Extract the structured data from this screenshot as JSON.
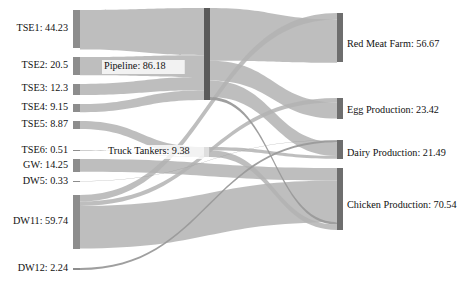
{
  "chart_data": {
    "type": "sankey",
    "title": "",
    "subtitle": "",
    "xlabel": "",
    "ylabel": "",
    "grid": false,
    "legend": "none",
    "background_color": "#ffffff",
    "node_color_source": "#8d8d8d",
    "node_color_middle": "#5a5a5a",
    "node_color_target": "#6e6e6e",
    "link_color": "#b3b3b3",
    "link_color_dark": "#9a9a9a",
    "label_color": "#111111",
    "value_separator": ": ",
    "nodes": [
      {
        "id": "TSE1",
        "label": "TSE1",
        "value": 44.23,
        "display": "TSE1: 44.23",
        "column": "source",
        "label_side": "left"
      },
      {
        "id": "TSE2",
        "label": "TSE2",
        "value": 20.5,
        "display": "TSE2: 20.5",
        "column": "source",
        "label_side": "left"
      },
      {
        "id": "TSE3",
        "label": "TSE3",
        "value": 12.3,
        "display": "TSE3: 12.3",
        "column": "source",
        "label_side": "left"
      },
      {
        "id": "TSE4",
        "label": "TSE4",
        "value": 9.15,
        "display": "TSE4: 9.15",
        "column": "source",
        "label_side": "left"
      },
      {
        "id": "TSE5",
        "label": "TSE5",
        "value": 8.87,
        "display": "TSE5: 8.87",
        "column": "source",
        "label_side": "left"
      },
      {
        "id": "TSE6",
        "label": "TSE6",
        "value": 0.51,
        "display": "TSE6: 0.51",
        "column": "source",
        "label_side": "left"
      },
      {
        "id": "GW",
        "label": "GW",
        "value": 14.25,
        "display": "GW: 14.25",
        "column": "source",
        "label_side": "left"
      },
      {
        "id": "DW5",
        "label": "DW5",
        "value": 0.33,
        "display": "DW5: 0.33",
        "column": "source",
        "label_side": "left"
      },
      {
        "id": "DW11",
        "label": "DW11",
        "value": 59.74,
        "display": "DW11: 59.74",
        "column": "source",
        "label_side": "left"
      },
      {
        "id": "DW12",
        "label": "DW12",
        "value": 2.24,
        "display": "DW12: 2.24",
        "column": "source",
        "label_side": "left"
      },
      {
        "id": "Pipeline",
        "label": "Pipeline",
        "value": 86.18,
        "display": "Pipeline: 86.18",
        "column": "middle",
        "label_side": "mid"
      },
      {
        "id": "TruckTankers",
        "label": "Truck Tankers",
        "value": 9.38,
        "display": "Truck Tankers: 9.38",
        "column": "middle",
        "label_side": "mid"
      },
      {
        "id": "RedMeatFarm",
        "label": "Red Meat Farm",
        "value": 56.67,
        "display": "Red Meat Farm: 56.67",
        "column": "target",
        "label_side": "right"
      },
      {
        "id": "EggProduction",
        "label": "Egg Production",
        "value": 23.42,
        "display": "Egg Production: 23.42",
        "column": "target",
        "label_side": "right"
      },
      {
        "id": "DairyProduction",
        "label": "Dairy Production",
        "value": 21.49,
        "display": "Dairy Production: 21.49",
        "column": "target",
        "label_side": "right"
      },
      {
        "id": "ChickenProduction",
        "label": "Chicken Production",
        "value": 70.54,
        "display": "Chicken Production: 70.54",
        "column": "target",
        "label_side": "right"
      }
    ],
    "links": [
      {
        "source": "TSE1",
        "target": "Pipeline",
        "value": 44.23
      },
      {
        "source": "TSE2",
        "target": "Pipeline",
        "value": 20.5
      },
      {
        "source": "TSE3",
        "target": "Pipeline",
        "value": 12.3
      },
      {
        "source": "TSE4",
        "target": "Pipeline",
        "value": 9.15
      },
      {
        "source": "TSE5",
        "target": "TruckTankers",
        "value": 8.87
      },
      {
        "source": "TSE6",
        "target": "TruckTankers",
        "value": 0.51
      },
      {
        "source": "GW",
        "target": "ChickenProduction",
        "value": 14.25
      },
      {
        "source": "DW5",
        "target": "DairyProduction",
        "value": 0.33
      },
      {
        "source": "DW11",
        "target": "ChickenProduction",
        "value": 47.54
      },
      {
        "source": "DW11",
        "target": "RedMeatFarm",
        "value": 7.3
      },
      {
        "source": "DW11",
        "target": "EggProduction",
        "value": 4.9
      },
      {
        "source": "DW12",
        "target": "DairyProduction",
        "value": 2.24
      },
      {
        "source": "Pipeline",
        "target": "RedMeatFarm",
        "value": 49.37
      },
      {
        "source": "Pipeline",
        "target": "EggProduction",
        "value": 18.52
      },
      {
        "source": "Pipeline",
        "target": "DairyProduction",
        "value": 15.54
      },
      {
        "source": "Pipeline",
        "target": "ChickenProduction",
        "value": 2.75
      },
      {
        "source": "TruckTankers",
        "target": "DairyProduction",
        "value": 3.38
      },
      {
        "source": "TruckTankers",
        "target": "ChickenProduction",
        "value": 6.0
      }
    ]
  },
  "layout": {
    "source_nodes": [
      {
        "id": "TSE1",
        "x": 73,
        "y": 10,
        "w": 7,
        "h": 38,
        "label_x": 68,
        "label_y": 29
      },
      {
        "id": "TSE2",
        "x": 73,
        "y": 57,
        "w": 7,
        "h": 18,
        "label_x": 68,
        "label_y": 66
      },
      {
        "id": "TSE3",
        "x": 73,
        "y": 84,
        "w": 7,
        "h": 11,
        "label_x": 68,
        "label_y": 89
      },
      {
        "id": "TSE4",
        "x": 73,
        "y": 104,
        "w": 7,
        "h": 8,
        "label_x": 68,
        "label_y": 108
      },
      {
        "id": "TSE5",
        "x": 73,
        "y": 121,
        "w": 7,
        "h": 8,
        "label_x": 68,
        "label_y": 125
      },
      {
        "id": "TSE6",
        "x": 73,
        "y": 150,
        "w": 7,
        "h": 1,
        "label_x": 68,
        "label_y": 151
      },
      {
        "id": "GW",
        "x": 73,
        "y": 159,
        "w": 7,
        "h": 13,
        "label_x": 68,
        "label_y": 166
      },
      {
        "id": "DW5",
        "x": 73,
        "y": 181,
        "w": 7,
        "h": 1,
        "label_x": 68,
        "label_y": 182
      },
      {
        "id": "DW11",
        "x": 73,
        "y": 195,
        "w": 7,
        "h": 54,
        "label_x": 68,
        "label_y": 222
      },
      {
        "id": "DW12",
        "x": 73,
        "y": 268,
        "w": 7,
        "h": 2,
        "label_x": 68,
        "label_y": 269
      }
    ],
    "middle_nodes": [
      {
        "id": "Pipeline",
        "x": 204,
        "y": 8,
        "w": 6,
        "h": 92,
        "label_x": 104,
        "label_y": 67
      },
      {
        "id": "TruckTankers",
        "x": 204,
        "y": 147,
        "w": 6,
        "h": 10,
        "label_x": 108,
        "label_y": 152
      }
    ],
    "target_nodes": [
      {
        "id": "RedMeatFarm",
        "x": 337,
        "y": 13,
        "w": 6,
        "h": 49,
        "label_x": 347,
        "label_y": 45
      },
      {
        "id": "EggProduction",
        "x": 337,
        "y": 98,
        "w": 6,
        "h": 21,
        "label_x": 347,
        "label_y": 111
      },
      {
        "id": "DairyProduction",
        "x": 337,
        "y": 140,
        "w": 6,
        "h": 19,
        "label_x": 347,
        "label_y": 154
      },
      {
        "id": "ChickenProduction",
        "x": 337,
        "y": 168,
        "w": 6,
        "h": 62,
        "label_x": 347,
        "label_y": 206
      }
    ]
  }
}
